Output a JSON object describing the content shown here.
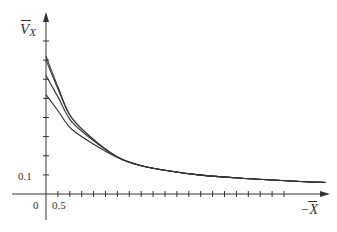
{
  "chart_data": {
    "type": "line",
    "title": "",
    "xlabel": "−X̄",
    "ylabel": "V̄x",
    "tick_labels": {
      "x": [
        "0",
        "0.5"
      ],
      "y": [
        "0.1"
      ]
    },
    "x_ticks_count": 20,
    "y_ticks_count": 8,
    "grid": false,
    "legend": null,
    "axis_ranges": {
      "x": [
        0,
        5.5
      ],
      "y": [
        0,
        0.8
      ]
    },
    "series": [
      {
        "name": "curve-1",
        "x": [
          0.0,
          0.25,
          0.5,
          1.0,
          1.5,
          2.0,
          3.0,
          4.0,
          5.0,
          5.5
        ],
        "y": [
          0.72,
          0.55,
          0.4,
          0.27,
          0.18,
          0.14,
          0.1,
          0.08,
          0.065,
          0.06
        ]
      },
      {
        "name": "curve-2",
        "x": [
          0.0,
          0.25,
          0.5,
          1.0,
          1.5,
          2.0,
          3.0,
          4.0,
          5.0,
          5.5
        ],
        "y": [
          0.7,
          0.54,
          0.4,
          0.27,
          0.18,
          0.14,
          0.1,
          0.08,
          0.065,
          0.06
        ]
      },
      {
        "name": "curve-3",
        "x": [
          0.0,
          0.25,
          0.5,
          1.0,
          1.5,
          2.0,
          3.0,
          4.0,
          5.0,
          5.5
        ],
        "y": [
          0.62,
          0.5,
          0.38,
          0.265,
          0.18,
          0.14,
          0.1,
          0.08,
          0.065,
          0.06
        ]
      },
      {
        "name": "curve-4",
        "x": [
          0.0,
          0.25,
          0.5,
          1.0,
          1.5,
          2.0,
          3.0,
          4.0,
          5.0,
          5.5
        ],
        "y": [
          0.52,
          0.43,
          0.34,
          0.25,
          0.18,
          0.14,
          0.1,
          0.08,
          0.065,
          0.06
        ]
      }
    ]
  },
  "labels": {
    "y_axis": "V",
    "y_axis_sub": "X",
    "x_axis": "−X",
    "tick_0": "0",
    "tick_05": "0.5",
    "tick_01": "0.1"
  }
}
